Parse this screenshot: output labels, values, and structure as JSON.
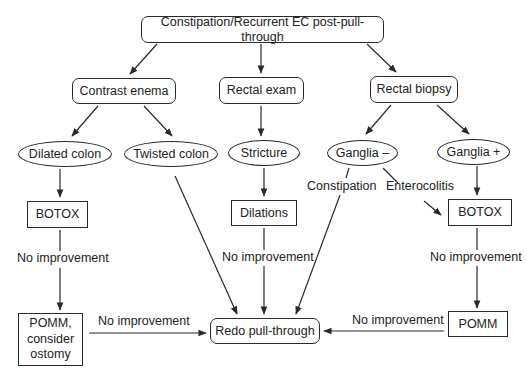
{
  "diagram": {
    "type": "flowchart",
    "nodes": {
      "root": {
        "label": "Constipation/Recurrent EC post-pull-through",
        "shape": "rounded"
      },
      "contrast_enema": {
        "label": "Contrast enema",
        "shape": "rounded"
      },
      "rectal_exam": {
        "label": "Rectal exam",
        "shape": "rounded"
      },
      "rectal_biopsy": {
        "label": "Rectal biopsy",
        "shape": "rounded"
      },
      "dilated_colon": {
        "label": "Dilated colon",
        "shape": "ellipse"
      },
      "twisted_colon": {
        "label": "Twisted colon",
        "shape": "ellipse"
      },
      "stricture": {
        "label": "Stricture",
        "shape": "ellipse"
      },
      "ganglia_neg": {
        "label": "Ganglia –",
        "shape": "ellipse"
      },
      "ganglia_pos": {
        "label": "Ganglia +",
        "shape": "ellipse"
      },
      "botox_left": {
        "label": "BOTOX",
        "shape": "rect"
      },
      "dilations": {
        "label": "Dilations",
        "shape": "rect"
      },
      "botox_right": {
        "label": "BOTOX",
        "shape": "rect"
      },
      "pomm_ostomy": {
        "label": "POMM,\nconsider\nostomy",
        "label_lines": [
          "POMM,",
          "consider",
          "ostomy"
        ],
        "shape": "rect"
      },
      "redo": {
        "label": "Redo pull-through",
        "shape": "rounded"
      },
      "pomm_right": {
        "label": "POMM",
        "shape": "rect"
      }
    },
    "edge_labels": {
      "no_improvement_left": "No improvement",
      "no_improvement_middle": "No improvement",
      "no_improvement_right": "No improvement",
      "no_improvement_bottom_left": "No improvement",
      "no_improvement_bottom_right": "No improvement",
      "constipation": "Constipation",
      "enterocolitis": "Enterocolitis"
    },
    "edges": [
      {
        "from": "root",
        "to": "contrast_enema"
      },
      {
        "from": "root",
        "to": "rectal_exam"
      },
      {
        "from": "root",
        "to": "rectal_biopsy"
      },
      {
        "from": "contrast_enema",
        "to": "dilated_colon"
      },
      {
        "from": "contrast_enema",
        "to": "twisted_colon"
      },
      {
        "from": "rectal_exam",
        "to": "stricture"
      },
      {
        "from": "rectal_biopsy",
        "to": "ganglia_neg"
      },
      {
        "from": "rectal_biopsy",
        "to": "ganglia_pos"
      },
      {
        "from": "dilated_colon",
        "to": "botox_left"
      },
      {
        "from": "stricture",
        "to": "dilations"
      },
      {
        "from": "ganglia_pos",
        "to": "botox_right"
      },
      {
        "from": "ganglia_neg",
        "to": "botox_right",
        "label": "Enterocolitis"
      },
      {
        "from": "ganglia_neg",
        "to": "redo",
        "label": "Constipation"
      },
      {
        "from": "twisted_colon",
        "to": "redo"
      },
      {
        "from": "botox_left",
        "to": "pomm_ostomy",
        "label": "No improvement"
      },
      {
        "from": "dilations",
        "to": "redo",
        "label": "No improvement"
      },
      {
        "from": "botox_right",
        "to": "pomm_right",
        "label": "No improvement"
      },
      {
        "from": "pomm_ostomy",
        "to": "redo",
        "label": "No improvement"
      },
      {
        "from": "pomm_right",
        "to": "redo",
        "label": "No improvement"
      }
    ],
    "colors": {
      "stroke": "#2a2a2a",
      "text": "#222222",
      "background": "#ffffff"
    }
  }
}
